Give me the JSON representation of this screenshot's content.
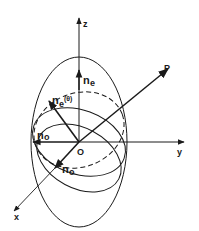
{
  "diagram": {
    "axes": {
      "z_label": "z",
      "y_label": "y",
      "x_label": "x",
      "origin_label": "O"
    },
    "vectors": {
      "propagation_label": "P"
    },
    "indices": {
      "ne_label": "n",
      "ne_sub": "e",
      "ne_theta_label": "n",
      "ne_theta_sub": "e",
      "ne_theta_arg": "(θ)",
      "no_left_label": "n",
      "no_left_sub": "o",
      "no_bottom_label": "n",
      "no_bottom_sub": "o"
    },
    "colors": {
      "stroke": "#1a1a1a",
      "background": "#ffffff"
    }
  }
}
